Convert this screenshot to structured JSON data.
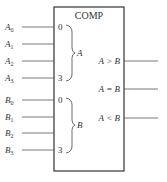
{
  "component": {
    "title": "COMP",
    "colors": {
      "stroke": "#333333",
      "text": "#333333",
      "background": "#ffffff"
    }
  },
  "inputs_a": {
    "group_label": "A",
    "pin_start": "0",
    "pin_end": "3",
    "signals": [
      {
        "name": "A",
        "sub": "0"
      },
      {
        "name": "A",
        "sub": "1"
      },
      {
        "name": "A",
        "sub": "2"
      },
      {
        "name": "A",
        "sub": "3"
      }
    ]
  },
  "inputs_b": {
    "group_label": "B",
    "pin_start": "0",
    "pin_end": "3",
    "signals": [
      {
        "name": "B",
        "sub": "0"
      },
      {
        "name": "B",
        "sub": "1"
      },
      {
        "name": "B",
        "sub": "2"
      },
      {
        "name": "B",
        "sub": "3"
      }
    ]
  },
  "outputs": [
    {
      "label": "A > B"
    },
    {
      "label": "A = B"
    },
    {
      "label": "A < B"
    }
  ]
}
